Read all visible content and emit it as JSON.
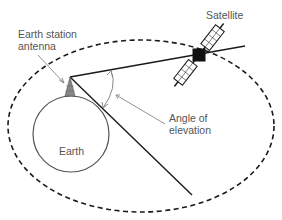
{
  "labels": {
    "satellite": "Satellite",
    "antenna_line1": "Earth station",
    "antenna_line2": "antenna",
    "earth": "Earth",
    "angle_line1": "Angle of",
    "angle_line2": "elevation"
  },
  "colors": {
    "line": "#1a1a1a",
    "label": "#555555",
    "leader": "#777777",
    "arc": "#888888"
  }
}
